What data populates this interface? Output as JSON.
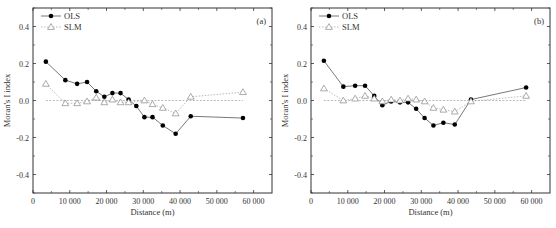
{
  "chart_data": [
    {
      "type": "line",
      "panel_label": "(a)",
      "xlabel": "Distance (m)",
      "ylabel": "Moran's I index",
      "xlim": [
        0,
        65000
      ],
      "ylim": [
        -0.5,
        0.5
      ],
      "x_ticks": [
        0,
        10000,
        20000,
        30000,
        40000,
        50000,
        60000
      ],
      "x_tick_labels": [
        "0",
        "10 000",
        "20 000",
        "30 000",
        "40 000",
        "50 000",
        "60 000"
      ],
      "y_ticks": [
        -0.4,
        -0.2,
        0.0,
        0.2,
        0.4
      ],
      "y_tick_labels": [
        "-0.4",
        "-0.2",
        "0.0",
        "0.2",
        "0.4"
      ],
      "reference_line": 0.0,
      "legend_position": "upper left",
      "grid": false,
      "series": [
        {
          "name": "OLS",
          "marker": "filled-circle",
          "line": "solid",
          "x": [
            3500,
            8800,
            12000,
            14700,
            17200,
            19400,
            21600,
            23800,
            26000,
            28100,
            30300,
            32500,
            35300,
            38800,
            42900,
            57100
          ],
          "values": [
            0.21,
            0.11,
            0.09,
            0.1,
            0.05,
            0.02,
            0.04,
            0.04,
            0.005,
            -0.03,
            -0.09,
            -0.09,
            -0.135,
            -0.18,
            -0.085,
            -0.095
          ]
        },
        {
          "name": "SLM",
          "marker": "open-triangle",
          "line": "dotted",
          "x": [
            3500,
            8800,
            12000,
            14700,
            17200,
            19400,
            21600,
            23800,
            26000,
            30300,
            32500,
            35300,
            38800,
            42900,
            57100
          ],
          "values": [
            0.09,
            -0.015,
            -0.015,
            -0.005,
            0.015,
            -0.01,
            0.005,
            -0.01,
            -0.01,
            0.0,
            -0.02,
            -0.04,
            -0.07,
            0.02,
            0.045
          ]
        }
      ]
    },
    {
      "type": "line",
      "panel_label": "(b)",
      "xlabel": "Distance (m)",
      "ylabel": "Moran's I index",
      "xlim": [
        0,
        65000
      ],
      "ylim": [
        -0.5,
        0.5
      ],
      "x_ticks": [
        0,
        10000,
        20000,
        30000,
        40000,
        50000,
        60000
      ],
      "x_tick_labels": [
        "0",
        "10 000",
        "20 000",
        "30 000",
        "40 000",
        "50 000",
        "60 000"
      ],
      "y_ticks": [
        -0.4,
        -0.2,
        0.0,
        0.2,
        0.4
      ],
      "y_tick_labels": [
        "-0.4",
        "-0.2",
        "0.0",
        "0.2",
        "0.4"
      ],
      "reference_line": 0.0,
      "legend_position": "upper left",
      "grid": false,
      "series": [
        {
          "name": "OLS",
          "marker": "filled-circle",
          "line": "solid",
          "x": [
            3500,
            8800,
            12000,
            14700,
            17200,
            19400,
            21800,
            24200,
            26400,
            28600,
            30900,
            33300,
            36000,
            39100,
            43500,
            58500
          ],
          "values": [
            0.215,
            0.075,
            0.08,
            0.08,
            0.025,
            -0.025,
            -0.005,
            -0.01,
            -0.01,
            -0.045,
            -0.095,
            -0.135,
            -0.12,
            -0.13,
            0.005,
            0.07
          ]
        },
        {
          "name": "SLM",
          "marker": "open-triangle",
          "line": "dotted",
          "x": [
            3500,
            8800,
            12000,
            14700,
            17200,
            19400,
            21800,
            24200,
            26400,
            28600,
            30900,
            33300,
            36000,
            39100,
            43500,
            58500
          ],
          "values": [
            0.065,
            0.0,
            0.01,
            0.025,
            0.01,
            -0.005,
            0.005,
            0.0,
            0.01,
            0.005,
            -0.005,
            -0.04,
            -0.05,
            -0.06,
            -0.005,
            0.025
          ]
        }
      ]
    }
  ],
  "colors": {
    "ols_line": "#555555",
    "ols_marker": "#000000",
    "slm_line": "#aaaaaa",
    "slm_marker": "#888888",
    "zero_line": "#aaaaaa",
    "axis": "#333333"
  }
}
